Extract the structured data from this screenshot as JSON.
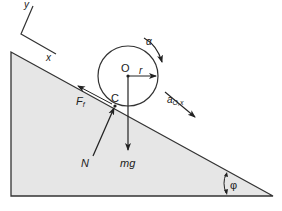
{
  "figure": {
    "colors": {
      "background": "#ffffff",
      "wedge_fill": "#e6e6e6",
      "line": "#222222"
    }
  },
  "axes": {
    "x_label": "x",
    "y_label": "y"
  },
  "disk": {
    "center_label": "O",
    "radius_label": "r",
    "contact_label": "C",
    "angular_accel_label": "α"
  },
  "forces": {
    "friction": {
      "symbol": "F",
      "subscript": "f"
    },
    "normal": {
      "symbol": "N"
    },
    "weight": {
      "symbol": "mg"
    }
  },
  "acceleration": {
    "symbol": "a",
    "subscript": "O,x"
  },
  "incline": {
    "angle_label": "φ"
  }
}
